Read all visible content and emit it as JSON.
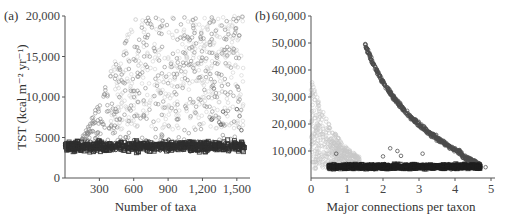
{
  "chart_data": [
    {
      "panel": "(a)",
      "type": "scatter",
      "title": "",
      "xlabel": "Number of taxa",
      "ylabel": "TST (kcal m⁻² yr⁻¹)",
      "xlim": [
        0,
        1580
      ],
      "ylim": [
        0,
        20000
      ],
      "xticks": [
        300,
        600,
        900,
        1200,
        1500
      ],
      "xtick_labels": [
        "300",
        "600",
        "900",
        "1,200",
        "1,500"
      ],
      "yticks": [
        0,
        5000,
        10000,
        15000,
        20000
      ],
      "ytick_labels": [
        "0",
        "5000",
        "10,000",
        "15,000",
        "20,000"
      ],
      "grid": false,
      "legend": null,
      "series": [
        {
          "name": "dark band (squares)",
          "marker": "square",
          "color": "#333333",
          "description": "dense band around TST 3000-5000 across all taxa counts; cluster at 0-100 taxa spanning 2000-5000",
          "x_range": [
            0,
            1580
          ],
          "y_range": [
            2000,
            5000
          ]
        },
        {
          "name": "scattered circles (mid gray)",
          "marker": "circle",
          "color": "#777777",
          "description": "rising cloud from ~150 taxa reaching 20,000 by ~600 taxa, spread 5000-20000",
          "x_range": [
            150,
            1560
          ],
          "y_range": [
            4000,
            20000
          ]
        },
        {
          "name": "light gray circles",
          "marker": "circle",
          "color": "#cccccc",
          "description": "upper cloud fading at high taxa, 10,000-20,000",
          "x_range": [
            900,
            1560
          ],
          "y_range": [
            9000,
            19000
          ]
        },
        {
          "name": "outlier circles",
          "marker": "circle",
          "color": "#555555",
          "description": "sparse points between 5000-9000 at 900-1550 taxa",
          "points": [
            [
              1380,
              8200
            ],
            [
              1500,
              8500
            ],
            [
              1360,
              6600
            ],
            [
              1280,
              7200
            ],
            [
              1540,
              5900
            ]
          ]
        }
      ]
    },
    {
      "panel": "(b)",
      "type": "scatter",
      "title": "",
      "xlabel": "Major connections per taxon",
      "ylabel": "",
      "xlim": [
        0,
        5
      ],
      "ylim": [
        0,
        60000
      ],
      "xticks": [
        0,
        1,
        2,
        3,
        4,
        5
      ],
      "xtick_labels": [
        "0",
        "1",
        "2",
        "3",
        "4",
        "5"
      ],
      "yticks": [
        10000,
        20000,
        30000,
        40000,
        50000,
        60000
      ],
      "ytick_labels": [
        "10,000",
        "20,000",
        "30,000",
        "40,000",
        "50,000",
        "60,000"
      ],
      "grid": false,
      "legend": null,
      "series": [
        {
          "name": "dark gray decreasing curve",
          "marker": "circle",
          "color": "#555555",
          "description": "hyperbolic decay from ~50,000 at x=1.5 down to ~4000 at x=4.7",
          "points": [
            [
              1.5,
              50000
            ],
            [
              1.8,
              42000
            ],
            [
              2.0,
              35000
            ],
            [
              2.3,
              28000
            ],
            [
              2.6,
              22000
            ],
            [
              3.0,
              17000
            ],
            [
              3.4,
              12500
            ],
            [
              3.8,
              9000
            ],
            [
              4.2,
              6500
            ],
            [
              4.6,
              4500
            ]
          ]
        },
        {
          "name": "light gray decreasing cloud",
          "marker": "circle",
          "color": "#c8c8c8",
          "description": "from ~36,000 at x≈0.1 decreasing to ~5000 by x≈1.3",
          "points": [
            [
              0.05,
              36000
            ],
            [
              0.2,
              33000
            ],
            [
              0.3,
              28000
            ],
            [
              0.4,
              22000
            ],
            [
              0.6,
              15000
            ],
            [
              0.8,
              11000
            ],
            [
              1.0,
              8000
            ],
            [
              1.3,
              6000
            ]
          ]
        },
        {
          "name": "dark band (squares)",
          "marker": "square",
          "color": "#222222",
          "description": "dense band 2000-6000 from x≈0.5 to x≈4.7",
          "x_range": [
            0.5,
            4.7
          ],
          "y_range": [
            2000,
            6000
          ]
        },
        {
          "name": "outlier circles",
          "marker": "circle",
          "color": "#555555",
          "points": [
            [
              2.2,
              11000
            ],
            [
              2.4,
              10000
            ],
            [
              2.0,
              8000
            ],
            [
              2.5,
              8200
            ],
            [
              3.1,
              9000
            ],
            [
              0.7,
              9000
            ],
            [
              4.85,
              4000
            ]
          ]
        }
      ]
    }
  ],
  "panels": {
    "a": {
      "label": "(a)",
      "xlabel": "Number of taxa",
      "ylabel": "TST (kcal m⁻² yr⁻¹)"
    },
    "b": {
      "label": "(b)",
      "xlabel": "Major connections per taxon"
    }
  }
}
